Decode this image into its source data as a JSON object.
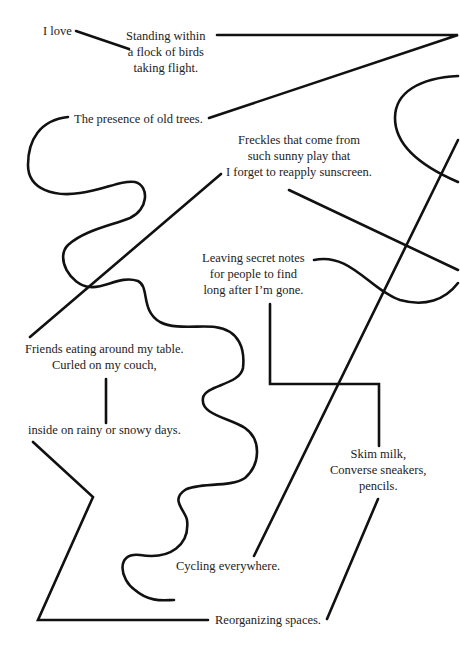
{
  "diagram": {
    "type": "connected-phrase-map",
    "background": "#ffffff",
    "line_color": "#111111",
    "text_color": "#222222",
    "nodes": [
      {
        "id": "i-love",
        "text": "I love"
      },
      {
        "id": "birds",
        "text": "Standing within\na flock of birds\ntaking flight."
      },
      {
        "id": "old-trees",
        "text": "The presence of old trees."
      },
      {
        "id": "freckles",
        "text": "Freckles that come from\nsuch sunny play that\nI forget to reapply sunscreen."
      },
      {
        "id": "secret-notes",
        "text": "Leaving secret notes\nfor people to find\nlong after I’m gone."
      },
      {
        "id": "friends",
        "text": "Friends eating around my table.\nCurled on my couch,"
      },
      {
        "id": "rainy",
        "text": "inside on rainy or snowy days."
      },
      {
        "id": "skim-milk",
        "text": "Skim milk,\nConverse sneakers,\npencils."
      },
      {
        "id": "cycling",
        "text": "Cycling everywhere."
      },
      {
        "id": "reorganizing",
        "text": "Reorganizing spaces."
      }
    ]
  }
}
